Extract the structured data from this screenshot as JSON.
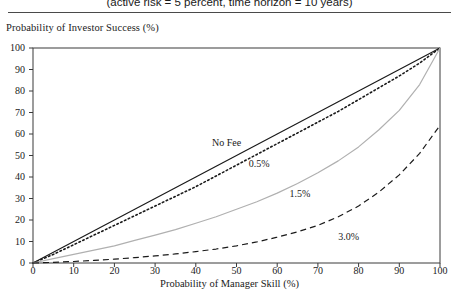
{
  "figure": {
    "title": "(active risk = 5 percent, time horizon = 10 years)",
    "ylabel": "Probability of Investor Success (%)",
    "xlabel": "Probability of Manager Skill (%)"
  },
  "chart_data": {
    "type": "line",
    "title": "(active risk = 5 percent, time horizon = 10 years)",
    "xlabel": "Probability of Manager Skill (%)",
    "ylabel": "Probability of Investor Success (%)",
    "xlim": [
      0,
      100
    ],
    "ylim": [
      0,
      100
    ],
    "xticks": [
      0,
      10,
      20,
      30,
      40,
      50,
      60,
      70,
      80,
      90,
      100
    ],
    "yticks": [
      0,
      10,
      20,
      30,
      40,
      50,
      60,
      70,
      80,
      90,
      100
    ],
    "grid": false,
    "legend": "inline-annotations",
    "x": [
      0,
      5,
      10,
      15,
      20,
      25,
      30,
      35,
      40,
      45,
      50,
      55,
      60,
      65,
      70,
      75,
      80,
      85,
      90,
      95,
      100
    ],
    "series": [
      {
        "name": "No Fee",
        "label": "No Fee",
        "color": "#1a1a1a",
        "style": "solid",
        "annotation_at": {
          "x": 44,
          "y": 56
        },
        "values": [
          0,
          5,
          10,
          15,
          20,
          25,
          30,
          35,
          40,
          45,
          50,
          55,
          60,
          65,
          70,
          75,
          80,
          85,
          90,
          95,
          100
        ]
      },
      {
        "name": "0.5%",
        "label": "0.5%",
        "color": "#1a1a1a",
        "style": "dotted",
        "annotation_at": {
          "x": 53,
          "y": 46
        },
        "values": [
          0,
          4,
          8.5,
          13,
          17.5,
          22,
          26.5,
          31,
          35.5,
          40.5,
          45.5,
          50.5,
          55.5,
          60.5,
          65.5,
          70.5,
          76,
          81.5,
          87,
          93,
          100
        ]
      },
      {
        "name": "1.5%",
        "label": "1.5%",
        "color": "#b0b0b0",
        "style": "solid",
        "annotation_at": {
          "x": 63,
          "y": 32
        },
        "values": [
          0,
          2,
          4,
          6,
          8,
          10.5,
          13,
          15.5,
          18.5,
          21.5,
          25,
          28.5,
          32.5,
          37,
          42,
          47.5,
          54,
          62,
          71,
          83,
          100
        ]
      },
      {
        "name": "3.0%",
        "label": "3.0%",
        "color": "#1a1a1a",
        "style": "dashed",
        "annotation_at": {
          "x": 75,
          "y": 12
        },
        "values": [
          0,
          0.3,
          0.7,
          1.2,
          1.8,
          2.5,
          3.3,
          4.2,
          5.3,
          6.5,
          8,
          9.8,
          12,
          14.5,
          17.5,
          21.5,
          26.5,
          33,
          41,
          51,
          64
        ]
      }
    ]
  },
  "axes": {
    "yticks": [
      "100",
      "90",
      "80",
      "70",
      "60",
      "50",
      "40",
      "30",
      "20",
      "10",
      "0"
    ],
    "xticks": [
      "0",
      "10",
      "20",
      "30",
      "40",
      "50",
      "60",
      "70",
      "80",
      "90",
      "100"
    ]
  }
}
